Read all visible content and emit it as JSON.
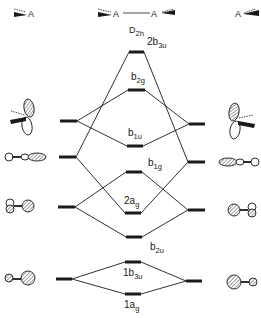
{
  "header": {
    "left_fragment": "A",
    "center_molecule": {
      "left_atom": "A",
      "right_atom": "A"
    },
    "right_fragment": "A",
    "symmetry": {
      "main": "D",
      "sub": "2h"
    }
  },
  "left_levels": [
    {
      "id": "L1",
      "y": 121,
      "orbital": "p-pi"
    },
    {
      "id": "L2",
      "y": 157,
      "orbital": "sp-hybrid-out"
    },
    {
      "id": "L3",
      "y": 207,
      "orbital": "sp-hybrid-in"
    },
    {
      "id": "L4",
      "y": 279,
      "orbital": "s-like"
    }
  ],
  "right_levels": [
    {
      "id": "R1",
      "y": 124,
      "orbital": "p-pi"
    },
    {
      "id": "R2",
      "y": 162,
      "orbital": "sp-hybrid-out"
    },
    {
      "id": "R3",
      "y": 210,
      "orbital": "sp-hybrid-in"
    },
    {
      "id": "R4",
      "y": 281,
      "orbital": "s-like"
    }
  ],
  "center_levels": [
    {
      "id": "2b3u",
      "num": "2",
      "main": "b",
      "sub": "3u",
      "y": 52
    },
    {
      "id": "b2g",
      "num": "",
      "main": "b",
      "sub": "2g",
      "y": 90
    },
    {
      "id": "b1u",
      "num": "",
      "main": "b",
      "sub": "1u",
      "y": 146
    },
    {
      "id": "b1g",
      "num": "",
      "main": "b",
      "sub": "1g",
      "y": 172
    },
    {
      "id": "2ag",
      "num": "2",
      "main": "a",
      "sub": "g",
      "y": 213
    },
    {
      "id": "b2u",
      "num": "",
      "main": "b",
      "sub": "2u",
      "y": 237
    },
    {
      "id": "1b3u",
      "num": "1",
      "main": "b",
      "sub": "3u",
      "y": 262
    },
    {
      "id": "1ag",
      "num": "1",
      "main": "a",
      "sub": "g",
      "y": 294
    }
  ],
  "labels": {
    "2b3u": {
      "num": "2",
      "main": "b",
      "sub": "3u"
    },
    "b2g": {
      "num": "",
      "main": "b",
      "sub": "2g"
    },
    "b1u": {
      "num": "",
      "main": "b",
      "sub": "1u"
    },
    "b1g": {
      "num": "",
      "main": "b",
      "sub": "1g"
    },
    "2ag": {
      "num": "2",
      "main": "a",
      "sub": "g"
    },
    "b2u": {
      "num": "",
      "main": "b",
      "sub": "2u"
    },
    "1b3u": {
      "num": "1",
      "main": "b",
      "sub": "3u"
    },
    "1ag": {
      "num": "1",
      "main": "a",
      "sub": "g"
    }
  },
  "correlations": [
    {
      "fragment": "L1/R1",
      "to": [
        "b2g",
        "b1u"
      ]
    },
    {
      "fragment": "L2/R2",
      "to": [
        "2b3u",
        "2ag"
      ]
    },
    {
      "fragment": "L3/R3",
      "to": [
        "b1g",
        "b2u"
      ]
    },
    {
      "fragment": "L4/R4",
      "to": [
        "1b3u",
        "1ag"
      ]
    }
  ]
}
